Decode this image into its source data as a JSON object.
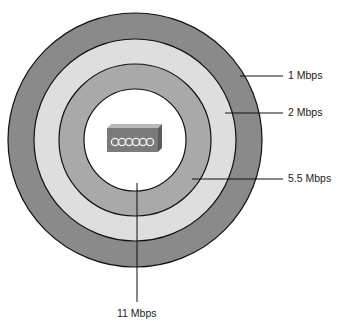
{
  "diagram": {
    "center_device": {
      "icon": "access-point-icon"
    },
    "rings": [
      {
        "rate": "1 Mbps",
        "fill": "#8a8a8a"
      },
      {
        "rate": "2 Mbps",
        "fill": "#dedede"
      },
      {
        "rate": "5.5 Mbps",
        "fill": "#a9a9a9"
      },
      {
        "rate": "11 Mbps",
        "fill": "#ffffff"
      }
    ],
    "labels": {
      "r1": "1 Mbps",
      "r2": "2 Mbps",
      "r55": "5.5 Mbps",
      "r11": "11 Mbps"
    }
  }
}
